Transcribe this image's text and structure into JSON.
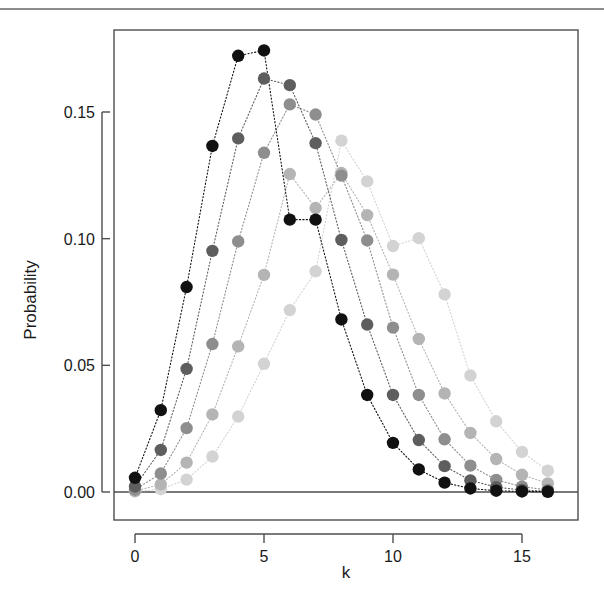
{
  "figure": {
    "top_rule_color": "#8c8c8c",
    "background": "#ffffff",
    "frame_color": "#4d4d4d"
  },
  "chart_data": {
    "type": "scatter",
    "title": "",
    "subtitle": "",
    "xlabel": "k",
    "ylabel": "Probability",
    "xlim": [
      -0.6,
      16.6
    ],
    "ylim": [
      0.0,
      0.1855
    ],
    "xticks": [
      0,
      5,
      10,
      15
    ],
    "xtick_labels": [
      "0",
      "5",
      "10",
      "15"
    ],
    "yticks": [
      0.0,
      0.05,
      0.1,
      0.15
    ],
    "ytick_labels": [
      "0.00",
      "0.05",
      "0.10",
      "0.15"
    ],
    "grid": false,
    "legend": "none",
    "x": [
      0,
      1,
      2,
      3,
      4,
      5,
      6,
      7,
      8,
      9,
      10,
      11,
      12,
      13,
      14,
      15,
      16
    ],
    "series": [
      {
        "name": "lambda-4.5",
        "color": "#111111",
        "values": [
          0.0056,
          0.0323,
          0.0809,
          0.1366,
          0.1722,
          0.1743,
          0.1075,
          0.1075,
          0.0681,
          0.0383,
          0.0194,
          0.0089,
          0.0037,
          0.0014,
          0.0005,
          0.0002,
          0.0001
        ]
      },
      {
        "name": "lambda-5.5",
        "color": "#5e5e5e",
        "values": [
          0.0022,
          0.0166,
          0.0486,
          0.0952,
          0.1396,
          0.1632,
          0.1606,
          0.1377,
          0.0995,
          0.0661,
          0.0383,
          0.0205,
          0.0102,
          0.0046,
          0.0019,
          0.0008,
          0.0003
        ]
      },
      {
        "name": "lambda-6.5",
        "color": "#8e8e8e",
        "values": [
          0.0009,
          0.0073,
          0.0252,
          0.0584,
          0.0989,
          0.1339,
          0.153,
          0.149,
          0.1249,
          0.0993,
          0.0649,
          0.0383,
          0.0208,
          0.0104,
          0.0048,
          0.0021,
          0.0008
        ]
      },
      {
        "name": "lambda-7.5",
        "color": "#b4b4b4",
        "values": [
          0.0004,
          0.003,
          0.0116,
          0.0306,
          0.0575,
          0.0857,
          0.1255,
          0.1121,
          0.1259,
          0.1093,
          0.0858,
          0.0604,
          0.0389,
          0.0233,
          0.013,
          0.0068,
          0.0034
        ]
      },
      {
        "name": "lambda-8.5",
        "color": "#d3d3d3",
        "values": [
          0.0002,
          0.0011,
          0.0049,
          0.014,
          0.0298,
          0.0506,
          0.0718,
          0.0871,
          0.1387,
          0.1226,
          0.0971,
          0.1002,
          0.078,
          0.046,
          0.0279,
          0.0158,
          0.0084
        ]
      }
    ]
  }
}
